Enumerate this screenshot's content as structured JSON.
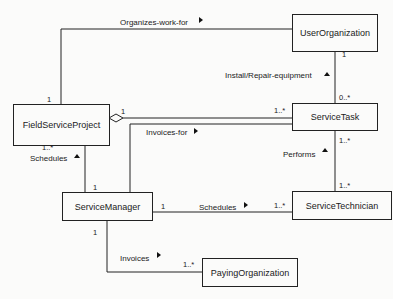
{
  "diagram": {
    "type": "UML class diagram",
    "classes": [
      {
        "id": "user_org",
        "name": "UserOrganization"
      },
      {
        "id": "fsp",
        "name": "FieldServiceProject"
      },
      {
        "id": "service_task",
        "name": "ServiceTask"
      },
      {
        "id": "service_manager",
        "name": "ServiceManager"
      },
      {
        "id": "service_technician",
        "name": "ServiceTechnician"
      },
      {
        "id": "paying_org",
        "name": "PayingOrganization"
      }
    ],
    "associations": [
      {
        "id": "organizes",
        "label": "Organizes-work-for",
        "direction": "right",
        "from": "FieldServiceProject",
        "to": "UserOrganization",
        "from_mult": "1",
        "to_mult": ""
      },
      {
        "id": "install",
        "label": "Install/Repair-equipment",
        "direction": "up",
        "from": "ServiceTask",
        "to": "UserOrganization",
        "from_mult": "0..*",
        "to_mult": "1"
      },
      {
        "id": "aggregation",
        "label": "",
        "type": "aggregation",
        "from": "FieldServiceProject",
        "to": "ServiceTask",
        "from_mult": "1",
        "to_mult": "1..*"
      },
      {
        "id": "invoices_for",
        "label": "Invoices-for",
        "direction": "right",
        "from": "ServiceManager",
        "to": "ServiceTask",
        "from_mult": "",
        "to_mult": ""
      },
      {
        "id": "schedules_fsp",
        "label": "Schedules",
        "direction": "up",
        "from": "ServiceManager",
        "to": "FieldServiceProject",
        "from_mult": "1",
        "to_mult": "1..*"
      },
      {
        "id": "performs",
        "label": "Performs",
        "direction": "up",
        "from": "ServiceTechnician",
        "to": "ServiceTask",
        "from_mult": "1..*",
        "to_mult": "1..*"
      },
      {
        "id": "schedules_tech",
        "label": "Schedules",
        "direction": "right",
        "from": "ServiceManager",
        "to": "ServiceTechnician",
        "from_mult": "1",
        "to_mult": "1..*"
      },
      {
        "id": "invoices",
        "label": "Invoices",
        "direction": "right",
        "from": "ServiceManager",
        "to": "PayingOrganization",
        "from_mult": "1",
        "to_mult": "1..*"
      }
    ]
  }
}
